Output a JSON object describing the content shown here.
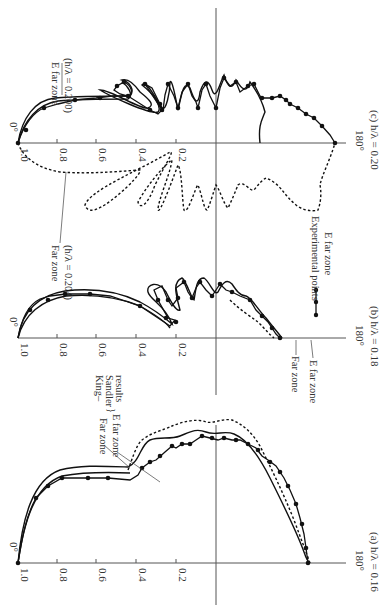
{
  "figure": {
    "orientation": "rotated 90° clockwise (page landscape)",
    "panels": [
      {
        "id": "a",
        "caption": "(a) h/λ = 0.16",
        "axis_y": 563
      },
      {
        "id": "b",
        "caption": "(b) h/λ = 0.18",
        "axis_y": 338
      },
      {
        "id": "c",
        "caption": "(c) h/λ = 0.20",
        "axis_y": 143
      }
    ],
    "tick_labels": [
      "1.0",
      "0.8",
      "0.6",
      "0.4",
      "0.2"
    ],
    "angle_labels": {
      "start": "0°",
      "end": "180°"
    },
    "annotations": {
      "a_far_zone": "Far zone",
      "a_e_far_zone": "E far zone",
      "a_king_sandler": [
        "King–",
        "Sandler",
        "results"
      ],
      "b_far_zone": "Far zone",
      "b_e_far_zone": "E far zone",
      "b_legend_line1": "Experimental points",
      "b_legend_line2": "E far zone",
      "c_e_far_zone": "E far zone",
      "c_e_far_zone_h": "(h/λ = 0.200)",
      "c_far_zone": "Far zone",
      "c_far_zone_h": "(h/λ = 0.204)"
    }
  },
  "chart_data": [
    {
      "type": "line",
      "title": "(a) h/λ = 0.16",
      "coordinate_system": "polar (rotated); radial ticks 1.0,0.8,0.6,0.4,0.2; angle 0° to 180°",
      "series": [
        {
          "name": "Far zone (King–Sandler)",
          "style": "dashed"
        },
        {
          "name": "E far zone (King–Sandler)",
          "style": "solid"
        },
        {
          "name": "Experimental points",
          "style": "solid-with-dots"
        }
      ]
    },
    {
      "type": "line",
      "title": "(b) h/λ = 0.18",
      "coordinate_system": "polar (rotated); radial ticks 1.0,0.8,0.6,0.4,0.2; angle 0° to 180°",
      "series": [
        {
          "name": "Far zone",
          "style": "dashed"
        },
        {
          "name": "E far zone",
          "style": "solid"
        },
        {
          "name": "Experimental points E far zone",
          "style": "solid-with-dots"
        }
      ]
    },
    {
      "type": "line",
      "title": "(c) h/λ = 0.20",
      "coordinate_system": "polar (rotated); radial ticks 1.0,0.8,0.6,0.4,0.2; angle 0° to 180°",
      "series": [
        {
          "name": "E far zone (h/λ = 0.200)",
          "style": "solid"
        },
        {
          "name": "Far zone (h/λ = 0.204)",
          "style": "dashed"
        },
        {
          "name": "Experimental points",
          "style": "solid-with-dots"
        }
      ]
    }
  ],
  "paths": {
    "c_solid_outer": "M18,143 C22,118 35,100 55,98 C80,96 110,96 130,96 C135,90 130,82 122,80 C128,78 135,85 140,92 C150,100 155,105 148,108 C140,110 112,90 100,90 C108,95 150,115 158,112 C162,108 155,95 142,85 C146,80 152,92 162,108 C166,112 170,92 170,82 C172,78 176,100 178,110 C182,92 184,80 190,88 C194,100 198,108 200,92 C204,80 208,78 212,90 C216,102 220,82 224,75 C228,88 232,90 236,80 C240,86 246,96 250,82 C256,90 262,100 265,112 C262,120 258,125 260,143",
    "c_solid_inner": "M18,143 C24,120 38,104 58,101 C80,99 110,99 128,99 C134,95 128,86 122,82",
    "c_exp": "M18,143 C24,124 34,112 44,108 L58,104 L75,100 L96,98 L112,96 L128,96 C134,94 132,86 124,82 L117,86 L114,90 L120,94 L128,96 L150,110 L158,114 L162,110 L145,84 L152,88 L160,104 L163,110 L165,95 L168,84 L174,96 L178,108 L182,92 L188,84 L192,96 L196,102 L198,108 L202,90 L206,84 L210,96 L216,108 L220,88 L224,78 L230,86 L236,82 L240,92 L248,86 L254,84 L260,96 L264,98 L272,98 L280,96 L286,100 L290,104 L298,108 L306,114 L314,118 L322,126 L330,135 L335,143",
    "c_dashed": "M18,143 C22,155 35,168 60,172 C90,174 110,172 140,170 C142,172 130,185 118,195 C100,210 88,215 85,205 C90,190 140,170 170,152 C175,150 165,165 155,185 C148,205 140,210 138,202 C150,180 170,160 172,160 C170,175 158,200 158,210 C160,215 176,170 178,165 C182,170 182,200 184,210 C188,215 196,185 198,185 C202,195 204,210 207,210 C210,205 214,190 216,185 C220,190 224,205 228,208 C232,200 236,190 238,185 C244,180 250,192 254,190 C258,185 262,180 266,178 C272,180 278,185 282,190 C286,195 290,200 296,205 C302,210 312,212 318,210 C320,205 322,195 320,185 C322,175 330,160 335,143",
    "b_solid_outer": "M18,338 C22,310 40,295 65,291 C90,288 115,290 140,302 C155,310 165,318 172,324 C165,305 150,300 148,292 C146,284 158,280 166,292 C170,300 176,312 180,310 C176,295 172,282 182,278 C186,280 192,300 194,300 C196,290 196,278 204,278 C210,282 214,296 218,292 C222,284 226,278 232,284 C236,290 240,296 246,296 C252,298 258,310 266,318 C272,326 276,330 282,338",
    "b_solid_inner": "M18,338 C24,314 42,300 66,296 C92,294 116,296 140,306 C154,314 166,322 170,328",
    "b_exp": "M18,338 C22,318 28,305 40,299 L50,296 L66,294 L90,294 L110,296 L140,306 L170,326 L175,320 L168,318 L158,300 L154,290 L162,286 L168,300 L172,306 L178,298 L176,288 L184,282 L188,292 L192,298 L196,288 L200,282 L206,290 L212,296 L216,290 L220,284 L226,290 L232,292 L240,296 L250,300 L256,310 L262,316 L268,322 L272,328 L276,334 L280,338",
    "b_dashed": "M230,300 C240,310 250,316 258,322 C266,330 270,335 274,338",
    "a_solid_outer": "M18,563 C22,520 32,480 60,470 C80,465 100,466 128,467 C140,462 140,445 150,440 C160,436 170,440 180,436 C190,432 196,428 206,432 C216,436 224,430 234,434 C244,438 256,450 270,478 C284,506 296,530 304,552 C306,558 308,562 310,563",
    "a_solid_inner": "M18,563 C24,522 34,486 62,476 C84,472 106,472 130,473",
    "a_dashed": "M128,470 C132,460 136,445 142,440 C152,432 164,430 172,426 C182,422 196,418 206,422 C214,424 222,418 232,420 C242,424 252,432 260,446 C270,466 282,490 294,520 C300,536 306,552 310,563",
    "a_exp": "M18,563 C22,538 26,516 36,498 L48,486 L62,478 L88,478 L108,478 L130,480 L138,475 L142,468 L150,462 L156,460 L165,452 L172,446 L176,448 L182,444 L190,444 L196,440 L202,436 L210,438 L218,440 L224,438 L232,440 L240,440 L248,444 L256,448 L262,456 L268,460 L276,466 L284,478 L290,490 L296,504 L300,518 L304,534 L306,548 L308,563"
  },
  "dots": {
    "c": [
      [
        18,
        143
      ],
      [
        26,
        130
      ],
      [
        44,
        108
      ],
      [
        75,
        100
      ],
      [
        100,
        98
      ],
      [
        128,
        96
      ],
      [
        124,
        82
      ],
      [
        117,
        86
      ],
      [
        150,
        110
      ],
      [
        162,
        110
      ],
      [
        145,
        84
      ],
      [
        160,
        104
      ],
      [
        168,
        84
      ],
      [
        178,
        108
      ],
      [
        188,
        84
      ],
      [
        198,
        108
      ],
      [
        206,
        84
      ],
      [
        216,
        108
      ],
      [
        224,
        78
      ],
      [
        236,
        82
      ],
      [
        248,
        86
      ],
      [
        254,
        84
      ],
      [
        262,
        98
      ],
      [
        272,
        98
      ],
      [
        280,
        96
      ],
      [
        286,
        100
      ],
      [
        290,
        104
      ],
      [
        298,
        108
      ],
      [
        306,
        114
      ],
      [
        314,
        118
      ],
      [
        322,
        126
      ],
      [
        335,
        143
      ]
    ],
    "b": [
      [
        30,
        310
      ],
      [
        48,
        300
      ],
      [
        65,
        294
      ],
      [
        90,
        294
      ],
      [
        140,
        306
      ],
      [
        176,
        322
      ],
      [
        166,
        318
      ],
      [
        158,
        300
      ],
      [
        168,
        300
      ],
      [
        178,
        298
      ],
      [
        184,
        282
      ],
      [
        192,
        298
      ],
      [
        200,
        282
      ],
      [
        212,
        296
      ],
      [
        220,
        284
      ],
      [
        232,
        292
      ],
      [
        250,
        300
      ],
      [
        262,
        316
      ],
      [
        272,
        328
      ],
      [
        280,
        338
      ]
    ],
    "a": [
      [
        18,
        563
      ],
      [
        36,
        498
      ],
      [
        48,
        486
      ],
      [
        62,
        478
      ],
      [
        88,
        478
      ],
      [
        108,
        478
      ],
      [
        142,
        468
      ],
      [
        150,
        462
      ],
      [
        160,
        456
      ],
      [
        172,
        446
      ],
      [
        182,
        444
      ],
      [
        190,
        444
      ],
      [
        202,
        436
      ],
      [
        212,
        438
      ],
      [
        224,
        438
      ],
      [
        236,
        440
      ],
      [
        248,
        444
      ],
      [
        258,
        450
      ],
      [
        270,
        462
      ],
      [
        280,
        472
      ],
      [
        288,
        486
      ],
      [
        296,
        504
      ],
      [
        302,
        524
      ],
      [
        306,
        548
      ],
      [
        308,
        563
      ]
    ]
  }
}
